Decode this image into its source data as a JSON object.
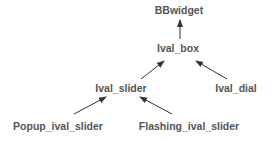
{
  "diagram": {
    "type": "class-hierarchy",
    "nodes": [
      {
        "id": "bbwidget",
        "label": "BBwidget",
        "x": 179,
        "y": 4
      },
      {
        "id": "ival_box",
        "label": "Ival_box",
        "x": 178,
        "y": 42
      },
      {
        "id": "ival_slider",
        "label": "Ival_slider",
        "x": 121,
        "y": 82
      },
      {
        "id": "ival_dial",
        "label": "Ival_dial",
        "x": 236,
        "y": 82
      },
      {
        "id": "popup_ival_slider",
        "label": "Popup_ival_slider",
        "x": 58,
        "y": 120
      },
      {
        "id": "flashing_ival_slider",
        "label": "Flashing_ival_slider",
        "x": 189,
        "y": 120
      }
    ],
    "edges": [
      {
        "from": "ival_box",
        "to": "bbwidget"
      },
      {
        "from": "ival_slider",
        "to": "ival_box"
      },
      {
        "from": "ival_dial",
        "to": "ival_box"
      },
      {
        "from": "popup_ival_slider",
        "to": "ival_slider"
      },
      {
        "from": "flashing_ival_slider",
        "to": "ival_slider"
      }
    ],
    "colors": {
      "text": "#555555",
      "arrow": "#333333",
      "background": "#ffffff"
    }
  }
}
